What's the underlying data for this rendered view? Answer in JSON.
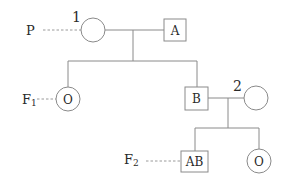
{
  "generations": {
    "p": {
      "label": "P"
    },
    "f1": {
      "label": "F",
      "sub": "1"
    },
    "f2": {
      "label": "F",
      "sub": "2"
    }
  },
  "individuals": {
    "p_female": {
      "number": "1",
      "blood_type": ""
    },
    "p_male": {
      "blood_type": "A"
    },
    "f1_female": {
      "blood_type": "O"
    },
    "f1_male": {
      "blood_type": "B"
    },
    "spouse_female": {
      "number": "2",
      "blood_type": ""
    },
    "f2_male": {
      "blood_type": "AB"
    },
    "f2_female": {
      "blood_type": "O"
    }
  },
  "colors": {
    "line": "#8a8a8a",
    "text": "#2a2a2a"
  }
}
